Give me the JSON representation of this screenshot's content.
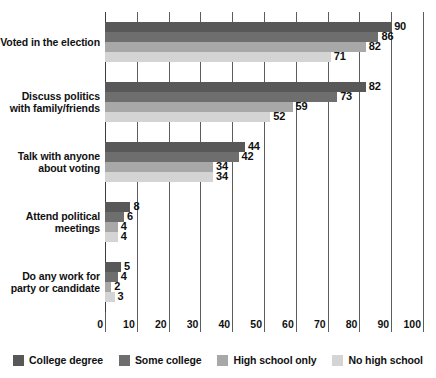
{
  "chart_data": {
    "type": "bar",
    "orientation": "horizontal",
    "title": "",
    "subtitle": "",
    "xlabel": "",
    "ylabel": "",
    "xlim": [
      0,
      100
    ],
    "xticks": [
      0,
      10,
      20,
      30,
      40,
      50,
      60,
      70,
      80,
      90,
      100
    ],
    "xtick_labels": [
      "0",
      "10",
      "20",
      "30",
      "40",
      "50",
      "60",
      "70",
      "80",
      "90",
      "100"
    ],
    "grid": true,
    "grid_axis": "x",
    "legend_position": "bottom",
    "categories": [
      "Voted in the election",
      "Discuss politics with family/friends",
      "Talk with anyone about voting",
      "Attend political meetings",
      "Do any work for party or candidate"
    ],
    "category_lines": [
      [
        "Voted in the election"
      ],
      [
        "Discuss politics",
        "with family/friends"
      ],
      [
        "Talk with anyone",
        "about voting"
      ],
      [
        "Attend political",
        "meetings"
      ],
      [
        "Do any work for",
        "party or candidate"
      ]
    ],
    "series": [
      {
        "name": "College degree",
        "color": "#585858",
        "values": [
          90,
          82,
          44,
          8,
          5
        ]
      },
      {
        "name": "Some college",
        "color": "#6e6e6e",
        "values": [
          86,
          73,
          42,
          6,
          4
        ]
      },
      {
        "name": "High school only",
        "color": "#a8a8a8",
        "values": [
          82,
          59,
          34,
          4,
          2
        ]
      },
      {
        "name": "No high school",
        "color": "#d4d4d4",
        "values": [
          71,
          52,
          34,
          4,
          3
        ]
      }
    ],
    "value_labels": [
      [
        "90",
        "86",
        "82",
        "71"
      ],
      [
        "82",
        "73",
        "59",
        "52"
      ],
      [
        "44",
        "42",
        "34",
        "34"
      ],
      [
        "8",
        "6",
        "4",
        "4"
      ],
      [
        "5",
        "4",
        "2",
        "3"
      ]
    ]
  },
  "legend": {
    "items": [
      {
        "label": "College degree",
        "color": "#585858"
      },
      {
        "label": "Some college",
        "color": "#6e6e6e"
      },
      {
        "label": "High school only",
        "color": "#a8a8a8"
      },
      {
        "label": "No high school",
        "color": "#d4d4d4"
      }
    ]
  }
}
